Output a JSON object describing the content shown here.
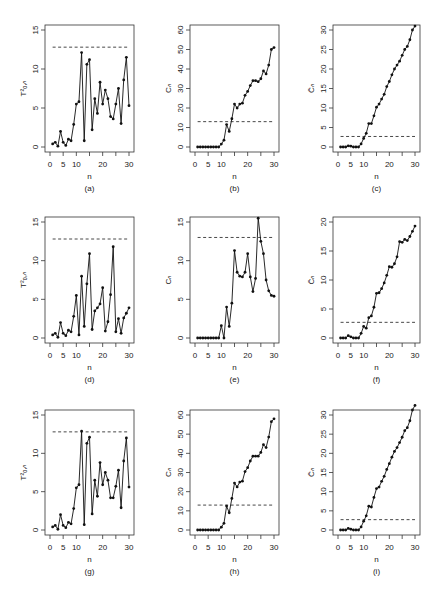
{
  "figure": {
    "layout": {
      "rows": 3,
      "cols": 3
    }
  },
  "chart_data": [
    {
      "id": "a",
      "caption": "(a)",
      "type": "line",
      "xlabel": "n",
      "ylabel": "T²ₒ,ₙ",
      "ylim": [
        0,
        15
      ],
      "yticks": [
        0,
        5,
        10,
        15
      ],
      "xlim": [
        0,
        30
      ],
      "xticks": [
        0,
        5,
        10,
        20,
        30
      ],
      "threshold": 12.8,
      "x": [
        1,
        2,
        3,
        4,
        5,
        6,
        7,
        8,
        9,
        10,
        11,
        12,
        13,
        14,
        15,
        16,
        17,
        18,
        19,
        20,
        21,
        22,
        23,
        24,
        25,
        26,
        27,
        28,
        29,
        30
      ],
      "values": [
        0.4,
        0.6,
        0.1,
        2.0,
        0.6,
        0.2,
        1.0,
        0.8,
        2.9,
        5.5,
        5.8,
        12.1,
        0.8,
        10.6,
        11.2,
        2.2,
        6.2,
        4.3,
        8.3,
        5.5,
        7.3,
        6.2,
        3.9,
        3.6,
        5.5,
        7.5,
        3.0,
        8.6,
        11.5,
        5.3
      ]
    },
    {
      "id": "b",
      "caption": "(b)",
      "type": "line",
      "xlabel": "n",
      "ylabel": "Cₙ",
      "ylim": [
        0,
        60
      ],
      "yticks": [
        0,
        10,
        20,
        30,
        40,
        50,
        60
      ],
      "xlim": [
        0,
        30
      ],
      "xticks": [
        0,
        5,
        10,
        20,
        30
      ],
      "threshold": 13,
      "x": [
        1,
        2,
        3,
        4,
        5,
        6,
        7,
        8,
        9,
        10,
        11,
        12,
        13,
        14,
        15,
        16,
        17,
        18,
        19,
        20,
        21,
        22,
        23,
        24,
        25,
        26,
        27,
        28,
        29,
        30
      ],
      "values": [
        0,
        0,
        0,
        0,
        0,
        0,
        0,
        0,
        0,
        1.5,
        3.5,
        11.5,
        8,
        14.5,
        22,
        20,
        22,
        22.5,
        26.5,
        28.5,
        31.5,
        34,
        34,
        33.5,
        35,
        39,
        37.5,
        42,
        50,
        51
      ]
    },
    {
      "id": "c",
      "caption": "(c)",
      "type": "line",
      "xlabel": "n",
      "ylabel": "C̃ₙ",
      "ylim": [
        0,
        30
      ],
      "yticks": [
        0,
        5,
        10,
        15,
        20,
        25,
        30
      ],
      "xlim": [
        0,
        30
      ],
      "xticks": [
        0,
        5,
        10,
        20,
        30
      ],
      "threshold": 2.7,
      "x": [
        1,
        2,
        3,
        4,
        5,
        6,
        7,
        8,
        9,
        10,
        11,
        12,
        13,
        14,
        15,
        16,
        17,
        18,
        19,
        20,
        21,
        22,
        23,
        24,
        25,
        26,
        27,
        28,
        29,
        30
      ],
      "values": [
        0,
        0,
        0,
        0.3,
        0.2,
        0,
        0,
        0,
        0.8,
        2.2,
        3.5,
        6,
        6,
        8,
        10.2,
        11,
        12.3,
        13.5,
        15.5,
        16.8,
        18.5,
        20,
        21,
        22,
        23.5,
        25,
        25.8,
        27.5,
        30,
        31
      ]
    },
    {
      "id": "d",
      "caption": "(d)",
      "type": "line",
      "xlabel": "n",
      "ylabel": "T²ₒ,ₙ",
      "ylim": [
        0,
        15
      ],
      "yticks": [
        0,
        5,
        10,
        15
      ],
      "xlim": [
        0,
        30
      ],
      "xticks": [
        0,
        5,
        10,
        20,
        30
      ],
      "threshold": 12.8,
      "x": [
        1,
        2,
        3,
        4,
        5,
        6,
        7,
        8,
        9,
        10,
        11,
        12,
        13,
        14,
        15,
        16,
        17,
        18,
        19,
        20,
        21,
        22,
        23,
        24,
        25,
        26,
        27,
        28,
        29,
        30
      ],
      "values": [
        0.4,
        0.6,
        0.1,
        2.0,
        0.6,
        0.3,
        1.0,
        0.8,
        2.8,
        5.5,
        0.4,
        8.0,
        1.5,
        7.0,
        10.9,
        1.1,
        3.5,
        3.9,
        4.4,
        6.5,
        0.9,
        2.1,
        5.6,
        11.8,
        0.8,
        2.5,
        0.6,
        2.6,
        3.2,
        3.9
      ]
    },
    {
      "id": "e",
      "caption": "(e)",
      "type": "line",
      "xlabel": "n",
      "ylabel": "Cₙ",
      "ylim": [
        0,
        15
      ],
      "yticks": [
        0,
        5,
        10,
        15
      ],
      "xlim": [
        0,
        30
      ],
      "xticks": [
        0,
        5,
        10,
        20,
        30
      ],
      "threshold": 13,
      "x": [
        1,
        2,
        3,
        4,
        5,
        6,
        7,
        8,
        9,
        10,
        11,
        12,
        13,
        14,
        15,
        16,
        17,
        18,
        19,
        20,
        21,
        22,
        23,
        24,
        25,
        26,
        27,
        28,
        29,
        30
      ],
      "values": [
        0,
        0,
        0,
        0,
        0,
        0,
        0,
        0,
        0,
        1.6,
        0,
        4.0,
        1.5,
        4.5,
        11.3,
        8.5,
        8.0,
        7.9,
        8.5,
        10.9,
        7.9,
        6.0,
        7.7,
        15.5,
        12.5,
        10.9,
        7.5,
        6.1,
        5.5,
        5.4
      ]
    },
    {
      "id": "f",
      "caption": "(f)",
      "type": "line",
      "xlabel": "n",
      "ylabel": "C̃ₙ",
      "ylim": [
        0,
        20
      ],
      "yticks": [
        0,
        5,
        10,
        15,
        20
      ],
      "xlim": [
        0,
        30
      ],
      "xticks": [
        0,
        5,
        10,
        20,
        30
      ],
      "threshold": 2.7,
      "x": [
        1,
        2,
        3,
        4,
        5,
        6,
        7,
        8,
        9,
        10,
        11,
        12,
        13,
        14,
        15,
        16,
        17,
        18,
        19,
        20,
        21,
        22,
        23,
        24,
        25,
        26,
        27,
        28,
        29,
        30
      ],
      "values": [
        0,
        0,
        0,
        0.4,
        0.2,
        0,
        0,
        0,
        0.8,
        2.0,
        1.7,
        3.5,
        3.8,
        5.3,
        7.7,
        7.8,
        8.5,
        9.5,
        10.8,
        12.3,
        12.2,
        12.8,
        14.0,
        16.6,
        16.5,
        17.0,
        16.8,
        17.5,
        18.4,
        19.3
      ]
    },
    {
      "id": "g",
      "caption": "(g)",
      "type": "line",
      "xlabel": "n",
      "ylabel": "T²ₒ,ₙ",
      "ylim": [
        0,
        15
      ],
      "yticks": [
        0,
        5,
        10,
        15
      ],
      "xlim": [
        0,
        30
      ],
      "xticks": [
        0,
        5,
        10,
        20,
        30
      ],
      "threshold": 12.8,
      "x": [
        1,
        2,
        3,
        4,
        5,
        6,
        7,
        8,
        9,
        10,
        11,
        12,
        13,
        14,
        15,
        16,
        17,
        18,
        19,
        20,
        21,
        22,
        23,
        24,
        25,
        26,
        27,
        28,
        29,
        30
      ],
      "values": [
        0.4,
        0.6,
        0.1,
        2.0,
        0.6,
        0.3,
        1.0,
        0.8,
        2.8,
        5.5,
        5.9,
        12.9,
        0.7,
        11.3,
        12.1,
        2.1,
        6.5,
        4.4,
        8.8,
        5.9,
        7.5,
        6.5,
        4.2,
        4.2,
        5.7,
        7.8,
        2.9,
        9.0,
        12.0,
        5.6
      ]
    },
    {
      "id": "h",
      "caption": "(h)",
      "type": "line",
      "xlabel": "n",
      "ylabel": "Cₙ",
      "ylim": [
        0,
        60
      ],
      "yticks": [
        0,
        10,
        20,
        30,
        40,
        50,
        60
      ],
      "xlim": [
        0,
        30
      ],
      "xticks": [
        0,
        5,
        10,
        20,
        30
      ],
      "threshold": 13,
      "x": [
        1,
        2,
        3,
        4,
        5,
        6,
        7,
        8,
        9,
        10,
        11,
        12,
        13,
        14,
        15,
        16,
        17,
        18,
        19,
        20,
        21,
        22,
        23,
        24,
        25,
        26,
        27,
        28,
        29,
        30
      ],
      "values": [
        0,
        0,
        0,
        0,
        0,
        0,
        0,
        0,
        0,
        1.5,
        3.5,
        12.5,
        9,
        16.5,
        24.5,
        22.5,
        25,
        25.5,
        30.5,
        32.5,
        36,
        38.5,
        38.5,
        38.5,
        40.5,
        44.5,
        43,
        48.5,
        56.5,
        58
      ]
    },
    {
      "id": "i",
      "caption": "(i)",
      "type": "line",
      "xlabel": "n",
      "ylabel": "C̃ₙ",
      "ylim": [
        0,
        30
      ],
      "yticks": [
        0,
        5,
        10,
        15,
        20,
        25,
        30
      ],
      "xlim": [
        0,
        30
      ],
      "xticks": [
        0,
        5,
        10,
        20,
        30
      ],
      "threshold": 2.7,
      "x": [
        1,
        2,
        3,
        4,
        5,
        6,
        7,
        8,
        9,
        10,
        11,
        12,
        13,
        14,
        15,
        16,
        17,
        18,
        19,
        20,
        21,
        22,
        23,
        24,
        25,
        26,
        27,
        28,
        29,
        30
      ],
      "values": [
        0,
        0,
        0,
        0.4,
        0.2,
        0,
        0,
        0,
        0.8,
        2.3,
        3.7,
        6.2,
        6.0,
        8.5,
        10.8,
        11.2,
        12.7,
        14,
        15.8,
        17.3,
        19,
        20.5,
        21.5,
        22.8,
        24.2,
        25.9,
        26.7,
        28.5,
        31.3,
        32.5
      ]
    }
  ]
}
